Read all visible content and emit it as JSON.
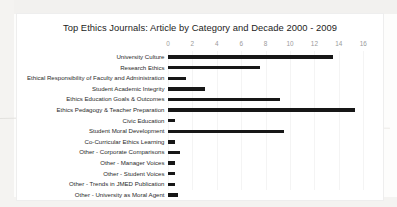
{
  "chart_data": {
    "type": "bar",
    "orientation": "horizontal",
    "title": "Top Ethics Journals: Article by Category and Decade 2000 - 2009",
    "xlabel": "",
    "ylabel": "",
    "xlim": [
      0,
      16
    ],
    "xticks": [
      0,
      2,
      4,
      6,
      8,
      10,
      12,
      14,
      16
    ],
    "grid": true,
    "legend": false,
    "bar_color": "#171717",
    "categories": [
      "University Culture",
      "Research Ethics",
      "Ethical Responsibility of Faculty and Administration",
      "Student Academic Integrity",
      "Ethics Education Goals & Outcomes",
      "Ethics Pedagogy & Teacher Preparation",
      "Civic Education",
      "Student Moral Development",
      "Co-Curricular Ethics Learning",
      "Other - Corporate Comparisons",
      "Other - Manager Voices",
      "Other - Student Voices",
      "Other - Trends in JMED Publication",
      "Other - University as Moral Agent"
    ],
    "values": [
      13.5,
      7.5,
      1.5,
      3,
      9.2,
      15.3,
      0.6,
      9.5,
      0.6,
      1,
      0.6,
      0.6,
      0.6,
      0.8
    ]
  }
}
